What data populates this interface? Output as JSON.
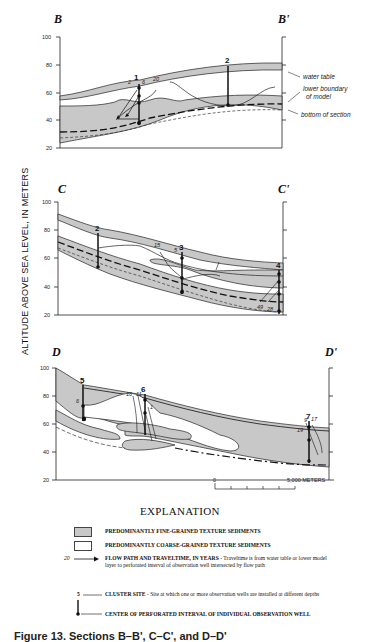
{
  "figure": {
    "y_axis_label": "ALTITUDE ABOVE SEA LEVEL, IN METERS",
    "y_ticks": [
      "100",
      "80",
      "60",
      "40",
      "20"
    ],
    "sections": [
      {
        "id": "B",
        "start_label": "B",
        "end_label": "B'",
        "wells": [
          "1",
          "2"
        ],
        "traveltimes": [
          "2",
          "6",
          "20"
        ],
        "annotations": [
          "water table",
          "lower boundary",
          "of model",
          "bottom of section"
        ]
      },
      {
        "id": "C",
        "start_label": "C",
        "end_label": "C'",
        "wells": [
          "2",
          "3",
          "4"
        ],
        "traveltimes": [
          "15",
          "5",
          "49",
          "28"
        ]
      },
      {
        "id": "D",
        "start_label": "D",
        "end_label": "D'",
        "wells": [
          "5",
          "6",
          "7"
        ],
        "traveltimes": [
          "6",
          "16",
          "11",
          "1",
          "9",
          "17",
          "19"
        ]
      }
    ],
    "scale_bar": {
      "start": "0",
      "end": "5,000 METERS"
    },
    "colors": {
      "fine_grained": "#c8c8c8",
      "coarse_grained": "#ffffff",
      "line": "#111111"
    }
  },
  "explanation": {
    "title": "EXPLANATION",
    "items": [
      {
        "symbol": "fine-swatch",
        "label": "PREDOMINANTLY FINE-GRAINED TEXTURE SEDIMENTS"
      },
      {
        "symbol": "coarse-swatch",
        "label": "PREDOMINANTLY COARSE-GRAINED TEXTURE SEDIMENTS"
      },
      {
        "symbol": "flow-arrow",
        "symbol_value": "20",
        "label": "FLOW PATH AND TRAVELTIME, IN YEARS",
        "description": " - Traveltime is from water table or lower model layer to perforated interval of observation well intersected by flow path"
      },
      {
        "symbol": "cluster-site",
        "symbol_value": "5",
        "label": "CLUSTER SITE",
        "description": " - Site at which one or more observation wells are installed at different depths"
      },
      {
        "symbol": "well-center",
        "label": "CENTER OF PERFORATED INTERVAL OF INDIVIDUAL OBSERVATION WELL"
      }
    ]
  },
  "caption": "Figure 13. Sections B–B', C–C', and D–D'"
}
